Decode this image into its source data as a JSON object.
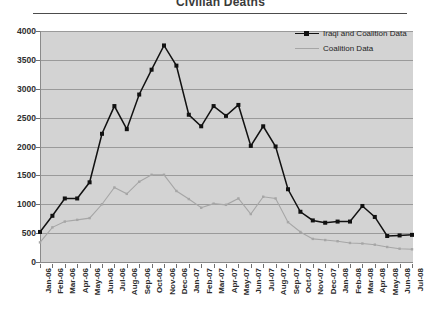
{
  "chart_data": {
    "type": "line",
    "title": "Civilian Deaths",
    "xlabel": "",
    "ylabel": "",
    "ylim": [
      0,
      4000
    ],
    "ytick_step": 500,
    "yticks": [
      4000,
      3500,
      3000,
      2500,
      2000,
      1500,
      1000,
      500,
      0
    ],
    "grid": true,
    "legend_position": "top-right",
    "plot_background": "#d3d3d3",
    "categories": [
      "Jan-06",
      "Feb-06",
      "Mar-06",
      "Apr-06",
      "May-06",
      "Jun-06",
      "Jul-06",
      "Aug-06",
      "Sep-06",
      "Oct-06",
      "Nov-06",
      "Dec-06",
      "Jan-07",
      "Feb-07",
      "Mar-07",
      "Apr-07",
      "May-07",
      "Jun-07",
      "Jul-07",
      "Aug-07",
      "Sep-07",
      "Oct-07",
      "Nov-07",
      "Dec-07",
      "Jan-08",
      "Feb-08",
      "Mar-08",
      "Apr-08",
      "May-08",
      "Jun-08",
      "Jul-08"
    ],
    "series": [
      {
        "name": "Iraqi and Coalition Data",
        "color": "#111111",
        "marker": "square",
        "values": [
          520,
          800,
          1100,
          1100,
          1380,
          2220,
          2700,
          2300,
          2900,
          3330,
          3750,
          3400,
          2550,
          2350,
          2700,
          2530,
          2720,
          2010,
          2350,
          2000,
          1260,
          870,
          720,
          680,
          700,
          700,
          970,
          780,
          450,
          460,
          470
        ]
      },
      {
        "name": "Coalition Data",
        "color": "#a6a6a6",
        "marker": "dot",
        "values": [
          340,
          600,
          700,
          730,
          760,
          1000,
          1290,
          1180,
          1390,
          1510,
          1510,
          1230,
          1090,
          940,
          1010,
          990,
          1100,
          830,
          1130,
          1100,
          690,
          520,
          400,
          380,
          360,
          330,
          320,
          300,
          260,
          230,
          220
        ]
      }
    ]
  },
  "legend": {
    "items": [
      {
        "label": "Iraqi and Coalition Data"
      },
      {
        "label": "Coalition Data"
      }
    ]
  }
}
